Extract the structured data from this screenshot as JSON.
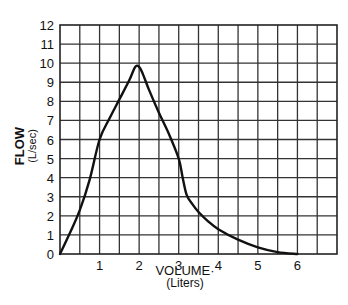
{
  "chart_data": {
    "type": "line",
    "title": "",
    "xlabel": "VOLUME·",
    "xlabel_unit": "(Liters)",
    "ylabel": "FLOW",
    "ylabel_unit": "(L/sec)",
    "xlim": [
      0,
      7
    ],
    "ylim": [
      0,
      12
    ],
    "x_ticks": [
      1,
      2,
      3,
      4,
      5,
      6
    ],
    "y_ticks": [
      0,
      1,
      2,
      3,
      4,
      5,
      6,
      7,
      8,
      9,
      10,
      11,
      12
    ],
    "grid": true,
    "grid_x_step": 0.5,
    "grid_y_step": 1,
    "legend": null,
    "series": [
      {
        "name": "Flow-volume curve",
        "color": "#111111",
        "x": [
          0,
          0.25,
          0.5,
          0.75,
          1.0,
          1.25,
          1.5,
          1.75,
          1.9,
          2.0,
          2.1,
          2.25,
          2.5,
          2.75,
          3.0,
          3.1,
          3.2,
          3.35,
          3.5,
          3.75,
          4.0,
          4.5,
          5.0,
          5.5,
          6.0
        ],
        "y": [
          0,
          1.1,
          2.3,
          3.9,
          6.0,
          7.1,
          8.1,
          9.1,
          9.8,
          9.8,
          9.4,
          8.6,
          7.4,
          6.3,
          5.0,
          4.0,
          3.1,
          2.6,
          2.2,
          1.7,
          1.3,
          0.75,
          0.35,
          0.1,
          0
        ]
      }
    ]
  }
}
